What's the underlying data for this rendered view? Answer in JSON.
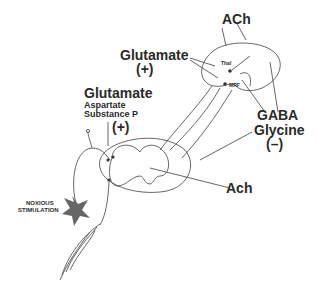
{
  "diagram": {
    "type": "neural pathway schematic",
    "labels": {
      "ach_top": "ACh",
      "glutamate_brainstem": "Glutamate",
      "plus_brainstem": "(+)",
      "glutamate_spinal": "Glutamate",
      "aspartate": "Aspartate",
      "substance_p": "Substance P",
      "plus_spinal": "(+)",
      "gaba": "GABA",
      "glycine": "Glycine",
      "minus": "(–)",
      "ach_spinal": "Ach",
      "noxious_line1": "NOXIOUS",
      "noxious_line2": "STIMULATION",
      "thal": "Thal",
      "mrf": "MRF"
    },
    "colors": {
      "line": "#555555",
      "text": "#2a2a2a",
      "star": "#666666"
    }
  }
}
